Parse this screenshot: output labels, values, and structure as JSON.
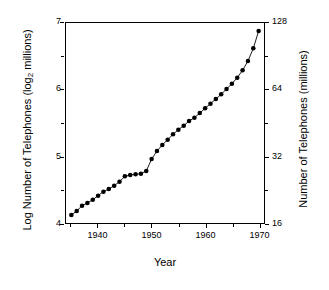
{
  "chart_data": {
    "type": "line",
    "title": "",
    "xlabel": "Year",
    "ylabel": "Log Number of Telephones (log2 millions)",
    "ylabel_right": "Number of Telephones (millions)",
    "xlim": [
      1934,
      1971
    ],
    "ylim": [
      4,
      7
    ],
    "grid": false,
    "legend": "none",
    "marker": "filled-circle",
    "line_color": "#000000",
    "marker_color": "#000000",
    "xticks_major": [
      1940,
      1950,
      1960,
      1970
    ],
    "xtick_labels": [
      "1940",
      "1950",
      "1960",
      "1970"
    ],
    "xticks_minor": [
      1935,
      1945,
      1955,
      1965
    ],
    "yticks_left": [
      4,
      5,
      6,
      7
    ],
    "ytick_labels_left": [
      "4",
      "5",
      "6",
      "7"
    ],
    "yticks_left_minor": [
      4.5,
      5.5,
      6.5
    ],
    "yticks_right": [
      4,
      5,
      6,
      7
    ],
    "ytick_labels_right": [
      "16",
      "32",
      "64",
      "128"
    ],
    "x": [
      1935,
      1936,
      1937,
      1938,
      1939,
      1940,
      1941,
      1942,
      1943,
      1944,
      1945,
      1946,
      1947,
      1948,
      1949,
      1950,
      1951,
      1952,
      1953,
      1954,
      1955,
      1956,
      1957,
      1958,
      1959,
      1960,
      1961,
      1962,
      1963,
      1964,
      1965,
      1966,
      1967,
      1968,
      1969,
      1970
    ],
    "values": [
      4.12,
      4.18,
      4.26,
      4.3,
      4.35,
      4.41,
      4.47,
      4.51,
      4.56,
      4.62,
      4.7,
      4.72,
      4.73,
      4.74,
      4.78,
      4.96,
      5.08,
      5.17,
      5.25,
      5.33,
      5.4,
      5.46,
      5.53,
      5.58,
      5.65,
      5.72,
      5.79,
      5.86,
      5.93,
      6.01,
      6.09,
      6.18,
      6.29,
      6.43,
      6.62,
      6.88
    ],
    "series": [
      {
        "name": "Telephones",
        "values": [
          4.12,
          4.18,
          4.26,
          4.3,
          4.35,
          4.41,
          4.47,
          4.51,
          4.56,
          4.62,
          4.7,
          4.72,
          4.73,
          4.74,
          4.78,
          4.96,
          5.08,
          5.17,
          5.25,
          5.33,
          5.4,
          5.46,
          5.53,
          5.58,
          5.65,
          5.72,
          5.79,
          5.86,
          5.93,
          6.01,
          6.09,
          6.18,
          6.29,
          6.43,
          6.62,
          6.88
        ]
      }
    ]
  },
  "axes": {
    "y_left_title_prefix": "Log Number of Telephones (log",
    "y_left_title_sub": "2",
    "y_left_title_suffix": " millions)",
    "y_right_title": "Number of Telephones (millions)",
    "x_title": "Year"
  }
}
